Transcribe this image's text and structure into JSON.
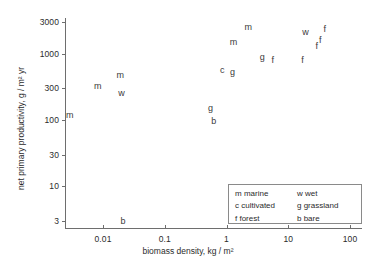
{
  "chart_data": {
    "type": "scatter",
    "title": "",
    "xlabel": "biomass density, kg / m²",
    "ylabel": "net primary productivity, g / m² yr",
    "xscale": "log",
    "yscale": "log",
    "xlim": [
      0.0025,
      100
    ],
    "ylim": [
      2.8,
      3600
    ],
    "grid": false,
    "legend_position": "lower-right",
    "xticks": [
      "0.01",
      "0.1",
      "1",
      "10",
      "100"
    ],
    "xtick_values": [
      0.01,
      0.1,
      1,
      10,
      100
    ],
    "yticks": [
      "3000",
      "1000",
      "300",
      "100",
      "30",
      "10",
      "3"
    ],
    "ytick_values": [
      3000,
      1000,
      300,
      100,
      30,
      10,
      3
    ],
    "point_labels": [
      "m",
      "w",
      "c",
      "g",
      "f",
      "b"
    ],
    "points": [
      {
        "label": "m",
        "x": 0.0029,
        "y": 120
      },
      {
        "label": "m",
        "x": 0.0082,
        "y": 330
      },
      {
        "label": "m",
        "x": 0.019,
        "y": 480
      },
      {
        "label": "w",
        "x": 0.02,
        "y": 255
      },
      {
        "label": "b",
        "x": 0.021,
        "y": 3
      },
      {
        "label": "g",
        "x": 0.55,
        "y": 150
      },
      {
        "label": "b",
        "x": 0.62,
        "y": 95
      },
      {
        "label": "c",
        "x": 0.85,
        "y": 560
      },
      {
        "label": "g",
        "x": 1.25,
        "y": 520
      },
      {
        "label": "m",
        "x": 1.3,
        "y": 1500
      },
      {
        "label": "m",
        "x": 2.25,
        "y": 2500
      },
      {
        "label": "g",
        "x": 3.8,
        "y": 900
      },
      {
        "label": "f",
        "x": 5.6,
        "y": 790
      },
      {
        "label": "f",
        "x": 17.0,
        "y": 800
      },
      {
        "label": "w",
        "x": 19.0,
        "y": 2100
      },
      {
        "label": "f",
        "x": 29.0,
        "y": 1300
      },
      {
        "label": "f",
        "x": 33.0,
        "y": 1600
      },
      {
        "label": "f",
        "x": 39.0,
        "y": 2350
      }
    ],
    "legend_entries": [
      {
        "key": "m",
        "label": "m marine",
        "column": 0
      },
      {
        "key": "c",
        "label": "c cultivated",
        "column": 0
      },
      {
        "key": "f",
        "label": "f forest",
        "column": 0
      },
      {
        "key": "w",
        "label": "w wet",
        "column": 1
      },
      {
        "key": "g",
        "label": "g grassland",
        "column": 1
      },
      {
        "key": "b",
        "label": "b bare",
        "column": 1
      }
    ]
  },
  "colors": {
    "axis": "#6e6e6e",
    "text": "#2b2b2b",
    "point": "#3a3a3a",
    "legend_border": "#8a8a8a",
    "background": "#ffffff"
  }
}
